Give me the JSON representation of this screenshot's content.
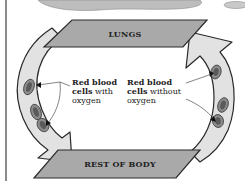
{
  "diagram": {
    "top_banner": "LUNGS",
    "bottom_banner": "REST OF BODY",
    "labels": [
      {
        "bold": "Red blood cells",
        "rest": "with oxygen",
        "line1": "Red blood",
        "line2_bold": "cells",
        "line2_rest": " with",
        "line3": "oxygen"
      },
      {
        "bold": "Red blood cells",
        "rest": "without oxygen",
        "line1": "Red blood",
        "line2_bold": "cells",
        "line2_rest": " without",
        "line3": "oxygen"
      }
    ],
    "arrows": [
      {
        "name": "left-arrow",
        "direction": "down",
        "from": "LUNGS",
        "to": "REST OF BODY"
      },
      {
        "name": "right-arrow",
        "direction": "up",
        "from": "REST OF BODY",
        "to": "LUNGS"
      }
    ],
    "colors": {
      "banner_fill": "#a9a9a9",
      "arrow_fill": "#e2e2e2",
      "outline": "#2a2a2a",
      "cell_fill": "#8c8c8c",
      "cell_dark": "#5a5a5a"
    }
  }
}
